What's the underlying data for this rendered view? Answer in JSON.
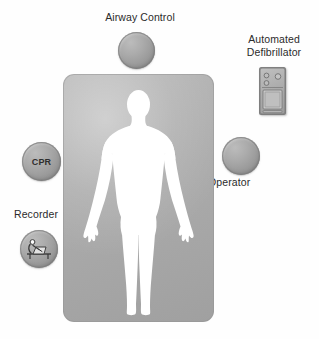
{
  "diagram": {
    "title_present": false,
    "background_color": "#ffffff",
    "mat": {
      "name": "patient-mat",
      "color": "#ababab",
      "figure_color": "#ffffff",
      "figure_description": "human-silhouette"
    },
    "stations": [
      {
        "id": "airway-control",
        "label": "Airway Control",
        "control_type": "circle-button",
        "icon": "circle-button-icon",
        "color": "#a0a0a0",
        "label_position": "above"
      },
      {
        "id": "automated-defibrillator",
        "label": "Automated\nDefibrillator",
        "control_type": "device-icon",
        "icon": "defibrillator-icon",
        "color": "#ababab",
        "label_position": "above"
      },
      {
        "id": "operator",
        "label": "Operator",
        "control_type": "circle-button",
        "icon": "circle-button-icon",
        "color": "#a0a0a0",
        "label_position": "below"
      },
      {
        "id": "cpr",
        "label": "CPR",
        "control_type": "circle-button",
        "icon": "text-label-icon",
        "color": "#a0a0a0",
        "label_position": "inside"
      },
      {
        "id": "recorder",
        "label": "Recorder",
        "control_type": "circle-button",
        "icon": "recorder-desk-icon",
        "color": "#a0a0a0",
        "label_position": "above"
      }
    ]
  },
  "text_color": "#2b2b2b"
}
